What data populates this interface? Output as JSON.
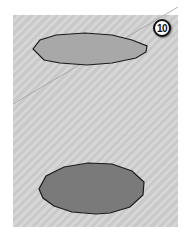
{
  "figure": {
    "step_badge": "10",
    "colors": {
      "panel_light": "#d6d6d6",
      "panel_dark": "#c9c9c9",
      "top_ellipse_fill": "#a8a8a8",
      "bottom_ellipse_fill": "#7a7a7a",
      "outline": "#1a1a1a",
      "guide_line": "#a0a0a0"
    }
  }
}
